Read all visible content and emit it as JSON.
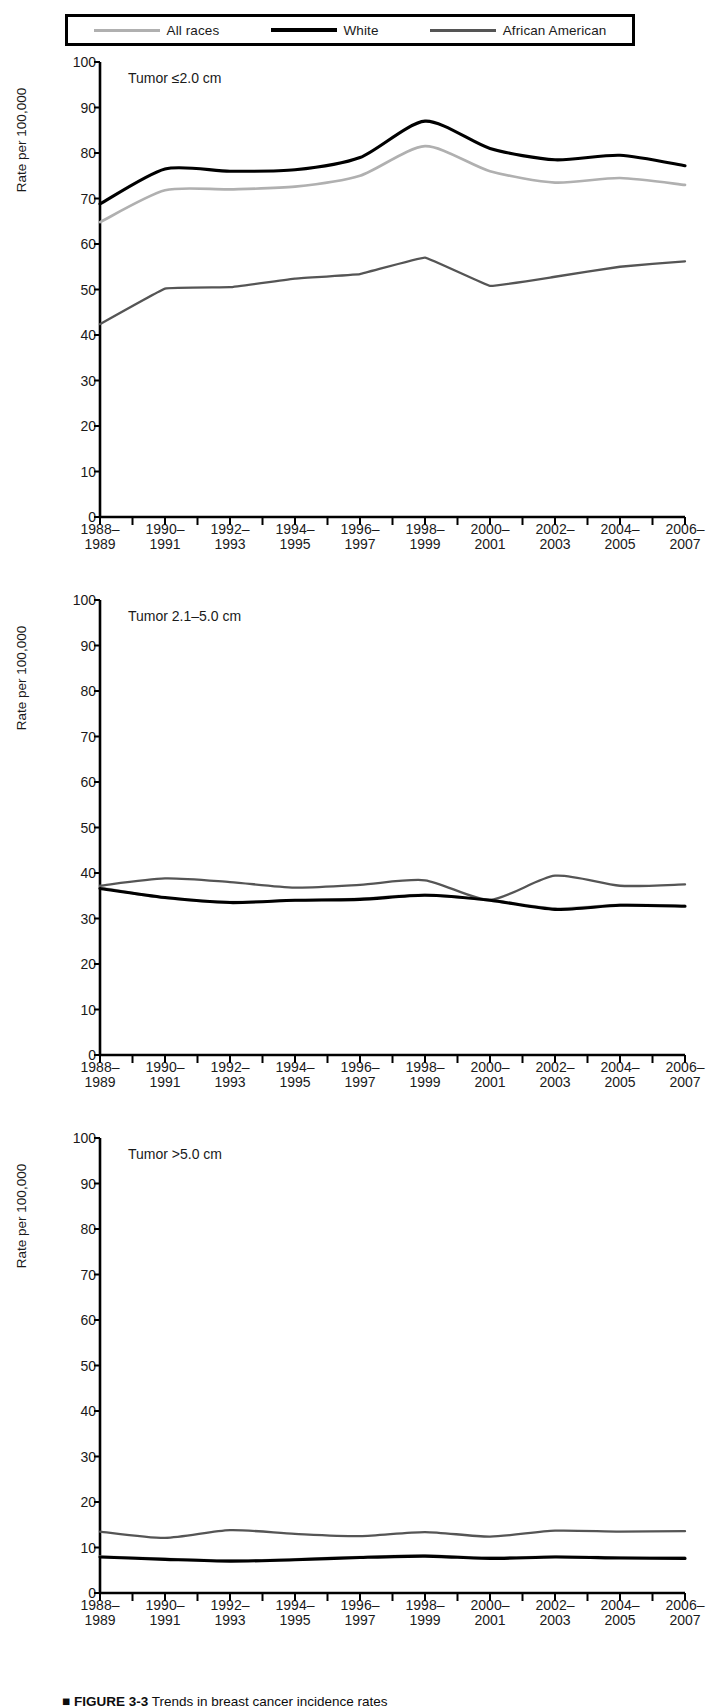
{
  "legend": {
    "position": "top-boxed",
    "items": [
      {
        "label": "All races",
        "color": "#b0b0b0",
        "key": "all_races"
      },
      {
        "label": "White",
        "color": "#000000",
        "key": "white"
      },
      {
        "label": "African American",
        "color": "#555555",
        "key": "african_american"
      }
    ]
  },
  "axis": {
    "ylabel": "Rate per 100,000",
    "yticks": [
      "0",
      "10",
      "20",
      "30",
      "40",
      "50",
      "60",
      "70",
      "80",
      "90",
      "100"
    ],
    "ylim": [
      0,
      100
    ],
    "xticks": [
      "1988–\n1989",
      "1990–\n1991",
      "1992–\n1993",
      "1994–\n1995",
      "1996–\n1997",
      "1998–\n1999",
      "2000–\n2001",
      "2002–\n2003",
      "2004–\n2005",
      "2006–\n2007"
    ],
    "grid": false
  },
  "caption": {
    "marker": "■",
    "figure_number": "FIGURE 3-3",
    "text": "Trends in breast cancer incidence rates"
  },
  "chart_data": [
    {
      "type": "line",
      "title": "Tumor ≤2.0 cm",
      "panel_index": 0,
      "xlabel": "",
      "ylabel": "Rate per 100,000",
      "ylim": [
        0,
        100
      ],
      "grid": false,
      "legend_position": "top-outside",
      "x": [
        "1988-1989",
        "1990-1991",
        "1992-1993",
        "1994-1995",
        "1996-1997",
        "1998-1999",
        "2000-2001",
        "2002-2003",
        "2004-2005",
        "2006-2007"
      ],
      "series": [
        {
          "name": "All races",
          "color": "#b0b0b0",
          "values": [
            64.8,
            71.8,
            72.0,
            72.6,
            75.0,
            81.5,
            76.0,
            73.5,
            74.5,
            73.0
          ]
        },
        {
          "name": "White",
          "color": "#000000",
          "values": [
            68.8,
            76.5,
            76.0,
            76.3,
            79.0,
            87.0,
            81.0,
            78.5,
            79.5,
            77.2
          ]
        },
        {
          "name": "African American",
          "color": "#555555",
          "values": [
            42.4,
            50.2,
            50.5,
            52.4,
            53.4,
            57.0,
            50.8,
            52.8,
            55.0,
            56.2
          ]
        }
      ]
    },
    {
      "type": "line",
      "title": "Tumor 2.1–5.0 cm",
      "panel_index": 1,
      "xlabel": "",
      "ylabel": "Rate per 100,000",
      "ylim": [
        0,
        100
      ],
      "grid": false,
      "legend_position": "top-outside",
      "x": [
        "1988-1989",
        "1990-1991",
        "1992-1993",
        "1994-1995",
        "1996-1997",
        "1998-1999",
        "2000-2001",
        "2002-2003",
        "2004-2005",
        "2006-2007"
      ],
      "series": [
        {
          "name": "All races",
          "color": "#b0b0b0",
          "values": [
            36.8,
            34.5,
            33.6,
            34.0,
            34.3,
            35.2,
            34.0,
            32.2,
            33.0,
            32.8
          ]
        },
        {
          "name": "White",
          "color": "#000000",
          "values": [
            36.6,
            34.6,
            33.5,
            34.0,
            34.2,
            35.1,
            34.0,
            32.0,
            32.9,
            32.7
          ]
        },
        {
          "name": "African American",
          "color": "#555555",
          "values": [
            37.2,
            38.8,
            38.0,
            36.8,
            37.4,
            38.4,
            34.1,
            39.4,
            37.2,
            37.5
          ]
        }
      ]
    },
    {
      "type": "line",
      "title": "Tumor >5.0 cm",
      "panel_index": 2,
      "xlabel": "",
      "ylabel": "Rate per 100,000",
      "ylim": [
        0,
        100
      ],
      "grid": false,
      "legend_position": "top-outside",
      "x": [
        "1988-1989",
        "1990-1991",
        "1992-1993",
        "1994-1995",
        "1996-1997",
        "1998-1999",
        "2000-2001",
        "2002-2003",
        "2004-2005",
        "2006-2007"
      ],
      "series": [
        {
          "name": "All races",
          "color": "#b0b0b0",
          "values": [
            8.0,
            7.5,
            7.1,
            7.4,
            7.9,
            8.2,
            7.7,
            8.0,
            7.8,
            7.7
          ]
        },
        {
          "name": "White",
          "color": "#000000",
          "values": [
            7.9,
            7.4,
            7.0,
            7.3,
            7.8,
            8.1,
            7.6,
            7.9,
            7.7,
            7.6
          ]
        },
        {
          "name": "African American",
          "color": "#555555",
          "values": [
            13.5,
            12.1,
            13.8,
            13.0,
            12.5,
            13.4,
            12.4,
            13.7,
            13.5,
            13.6
          ]
        }
      ]
    }
  ]
}
